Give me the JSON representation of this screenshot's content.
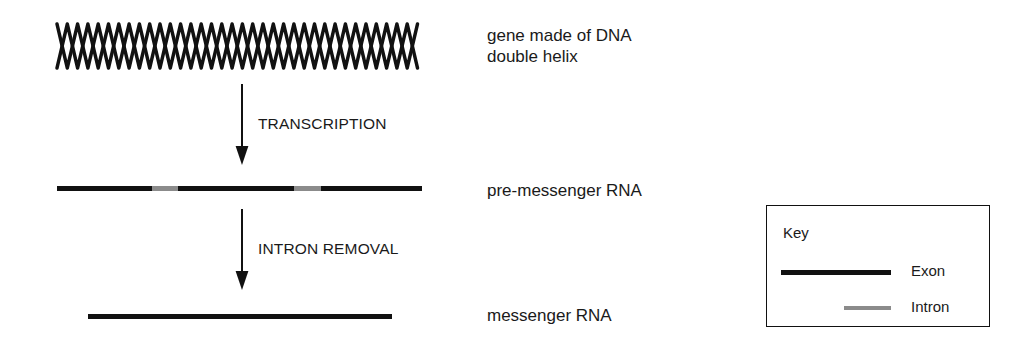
{
  "diagram": {
    "background_color": "#ffffff",
    "ink_color": "#111111",
    "intron_color": "#8b8b8b"
  },
  "rows": {
    "dna": {
      "label": "gene made of DNA\ndouble helix",
      "icon": "dna-double-helix-icon"
    },
    "pre_mrna": {
      "label": "pre-messenger RNA",
      "segments": [
        {
          "type": "exon",
          "length": 95
        },
        {
          "type": "intron",
          "length": 26
        },
        {
          "type": "exon",
          "length": 116
        },
        {
          "type": "intron",
          "length": 27
        },
        {
          "type": "exon",
          "length": 101
        }
      ]
    },
    "mrna": {
      "label": "messenger RNA",
      "segments": [
        {
          "type": "exon",
          "length": 304
        }
      ]
    }
  },
  "arrows": {
    "transcription": {
      "label": "TRANSCRIPTION",
      "icon": "down-arrow-icon"
    },
    "intron_removal": {
      "label": "INTRON REMOVAL",
      "icon": "down-arrow-icon"
    }
  },
  "key": {
    "title": "Key",
    "entries": [
      {
        "label": "Exon",
        "swatch": "exon-line-swatch"
      },
      {
        "label": "Intron",
        "swatch": "intron-line-swatch"
      }
    ]
  }
}
